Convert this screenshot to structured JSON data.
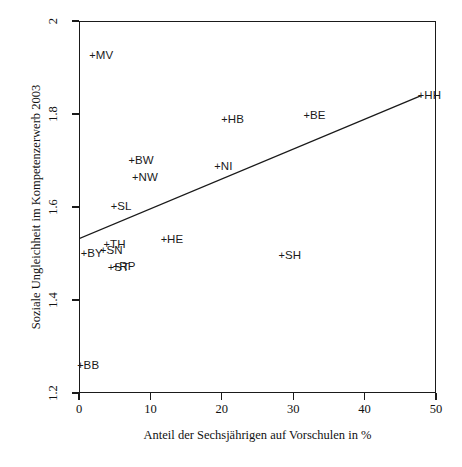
{
  "chart_data": {
    "type": "scatter",
    "title": "",
    "xlabel": "Anteil der Sechsjährigen auf Vorschulen in %",
    "ylabel": "Soziale Ungleichheit im Kompetenzerwerb 2003",
    "xlim": [
      0,
      50
    ],
    "ylim": [
      1.2,
      2.0
    ],
    "xticks": [
      "0",
      "10",
      "20",
      "30",
      "40",
      "50"
    ],
    "xtick_values": [
      0,
      10,
      20,
      30,
      40,
      50
    ],
    "yticks": [
      "1.2",
      "1.4",
      "1.6",
      "1.8",
      "2"
    ],
    "ytick_values": [
      1.2,
      1.4,
      1.6,
      1.8,
      2.0
    ],
    "grid": false,
    "legend": "none",
    "marker": "+",
    "marker_color": "#1a1a1a",
    "points": [
      {
        "label": "MV",
        "x": 2.0,
        "y": 1.925,
        "label_side": "right"
      },
      {
        "label": "HH",
        "x": 48.0,
        "y": 1.838,
        "label_side": "right"
      },
      {
        "label": "BE",
        "x": 32.0,
        "y": 1.795,
        "label_side": "right"
      },
      {
        "label": "HB",
        "x": 20.5,
        "y": 1.788,
        "label_side": "right"
      },
      {
        "label": "BW",
        "x": 7.5,
        "y": 1.7,
        "label_side": "right"
      },
      {
        "label": "NI",
        "x": 19.5,
        "y": 1.685,
        "label_side": "right"
      },
      {
        "label": "NW",
        "x": 8.0,
        "y": 1.663,
        "label_side": "right"
      },
      {
        "label": "SL",
        "x": 5.0,
        "y": 1.6,
        "label_side": "right"
      },
      {
        "label": "HE",
        "x": 12.0,
        "y": 1.528,
        "label_side": "right"
      },
      {
        "label": "TH",
        "x": 4.0,
        "y": 1.518,
        "label_side": "right"
      },
      {
        "label": "SN",
        "x": 3.5,
        "y": 1.505,
        "label_side": "right"
      },
      {
        "label": "BY",
        "x": 0.8,
        "y": 1.5,
        "label_side": "right"
      },
      {
        "label": "SH",
        "x": 28.5,
        "y": 1.495,
        "label_side": "right"
      },
      {
        "label": "RP",
        "x": 5.3,
        "y": 1.472,
        "label_side": "right"
      },
      {
        "label": "ST",
        "x": 4.6,
        "y": 1.468,
        "label_side": "right"
      },
      {
        "label": "BB",
        "x": 0.3,
        "y": 1.258,
        "label_side": "right"
      }
    ],
    "regression_line": {
      "x_start": 0.0,
      "y_start": 1.532,
      "x_end": 48.0,
      "y_end": 1.84,
      "color": "#1a1a1a"
    }
  }
}
